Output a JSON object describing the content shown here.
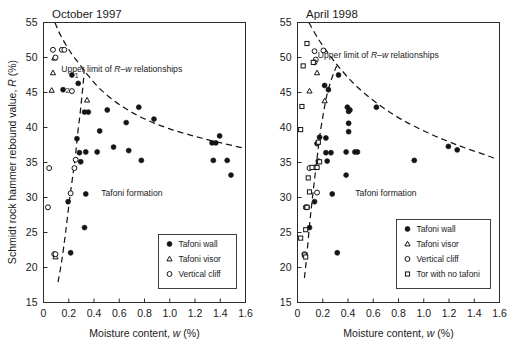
{
  "figure": {
    "width": 519,
    "height": 360,
    "background": "#ffffff",
    "ink_color": "#141414"
  },
  "axis": {
    "y_label": "Schmidt rock hammer rebound value, R (%)",
    "x_label": "Moisture content, w (%)",
    "y_ticks": [
      15,
      20,
      25,
      30,
      35,
      40,
      45,
      50,
      55
    ],
    "x_ticks": [
      "0",
      "0.2",
      "0.4",
      "0.6",
      "0.8",
      "1.0",
      "1.2",
      "1.4",
      "1.6"
    ],
    "ylim": [
      15,
      55
    ],
    "xlim": [
      0,
      1.6
    ]
  },
  "chart_data": [
    {
      "type": "scatter",
      "title": "October 1997",
      "xlabel": "Moisture content, w (%)",
      "ylabel": "Schmidt rock hammer rebound value, R (%)",
      "xlim": [
        0,
        1.6
      ],
      "ylim": [
        15,
        55
      ],
      "grid": false,
      "legend_position": "lower-right",
      "annotations": [
        {
          "text": "Upper limit of R–w relationships",
          "x": 0.62,
          "y": 48.0
        },
        {
          "text": "Tafoni formation",
          "x": 0.7,
          "y": 30.2
        },
        {
          "text": "1",
          "x": 0.245,
          "y": 47.5
        },
        {
          "text": "2",
          "x": 0.175,
          "y": 45.3
        }
      ],
      "series": [
        {
          "name": "Tafoni wall",
          "marker": "filled-circle",
          "points": [
            [
              0.225,
              47.5
            ],
            [
              0.155,
              45.4
            ],
            [
              0.275,
              46.3
            ],
            [
              0.325,
              42.2
            ],
            [
              0.355,
              42.2
            ],
            [
              0.505,
              42.5
            ],
            [
              0.445,
              39.5
            ],
            [
              0.655,
              40.7
            ],
            [
              0.755,
              42.9
            ],
            [
              0.875,
              41.2
            ],
            [
              0.335,
              36.5
            ],
            [
              0.425,
              36.5
            ],
            [
              0.555,
              37.2
            ],
            [
              0.675,
              36.7
            ],
            [
              0.775,
              35.3
            ],
            [
              0.265,
              38.4
            ],
            [
              0.295,
              35.1
            ],
            [
              0.285,
              36.4
            ],
            [
              0.335,
              30.5
            ],
            [
              0.325,
              25.7
            ],
            [
              0.195,
              29.4
            ],
            [
              0.215,
              22.1
            ],
            [
              1.335,
              37.8
            ],
            [
              1.365,
              37.8
            ],
            [
              1.395,
              38.8
            ],
            [
              1.345,
              35.3
            ],
            [
              1.455,
              35.3
            ],
            [
              1.485,
              33.2
            ]
          ]
        },
        {
          "name": "Tafoni visor",
          "marker": "open-triangle",
          "points": [
            [
              0.085,
              49.9
            ],
            [
              0.075,
              47.8
            ],
            [
              0.065,
              45.3
            ],
            [
              0.345,
              43.9
            ],
            [
              0.095,
              21.5
            ]
          ]
        },
        {
          "name": "Vertical cliff",
          "marker": "open-circle",
          "points": [
            [
              0.075,
              51.1
            ],
            [
              0.145,
              51.1
            ],
            [
              0.165,
              51.1
            ],
            [
              0.095,
              50.0
            ],
            [
              0.225,
              45.2
            ],
            [
              0.255,
              35.4
            ],
            [
              0.045,
              34.2
            ],
            [
              0.245,
              34.2
            ],
            [
              0.215,
              30.6
            ],
            [
              0.035,
              28.6
            ],
            [
              0.085,
              21.9
            ],
            [
              0.095,
              21.9
            ]
          ]
        }
      ],
      "upper_limit_curve": [
        [
          0.09,
          55.0
        ],
        [
          0.14,
          53.0
        ],
        [
          0.22,
          50.6
        ],
        [
          0.3,
          48.7
        ],
        [
          0.36,
          47.3
        ],
        [
          0.46,
          45.3
        ],
        [
          0.6,
          43.3
        ],
        [
          0.78,
          41.4
        ],
        [
          1.0,
          39.8
        ],
        [
          1.25,
          38.5
        ],
        [
          1.5,
          37.4
        ],
        [
          1.58,
          37.1
        ]
      ],
      "lower_limit_curve": [
        [
          0.115,
          17.9
        ],
        [
          0.145,
          21.0
        ],
        [
          0.175,
          25.0
        ],
        [
          0.205,
          29.5
        ],
        [
          0.235,
          33.5
        ],
        [
          0.255,
          36.3
        ],
        [
          0.272,
          39.3
        ],
        [
          0.29,
          42.0
        ],
        [
          0.305,
          44.6
        ],
        [
          0.318,
          47.0
        ],
        [
          0.322,
          48.3
        ]
      ]
    },
    {
      "type": "scatter",
      "title": "April 1998",
      "xlabel": "Moisture content, w (%)",
      "ylabel": "Schmidt rock hammer rebound value, R (%)",
      "xlim": [
        0,
        1.6
      ],
      "ylim": [
        15,
        55
      ],
      "grid": false,
      "legend_position": "lower-right",
      "annotations": [
        {
          "text": "Upper limit of R–w relationships",
          "x": 0.64,
          "y": 50.0
        },
        {
          "text": "Tafoni formation",
          "x": 0.7,
          "y": 30.2
        }
      ],
      "series": [
        {
          "name": "Tafoni wall",
          "marker": "filled-circle",
          "points": [
            [
              0.325,
              47.5
            ],
            [
              0.245,
              45.4
            ],
            [
              0.215,
              46.0
            ],
            [
              0.395,
              42.9
            ],
            [
              0.405,
              42.3
            ],
            [
              0.415,
              42.5
            ],
            [
              0.625,
              42.9
            ],
            [
              0.405,
              40.6
            ],
            [
              0.405,
              39.4
            ],
            [
              0.175,
              38.6
            ],
            [
              0.225,
              38.5
            ],
            [
              0.155,
              37.7
            ],
            [
              0.225,
              36.4
            ],
            [
              0.265,
              36.4
            ],
            [
              0.385,
              36.5
            ],
            [
              0.455,
              36.5
            ],
            [
              0.475,
              36.5
            ],
            [
              0.235,
              35.2
            ],
            [
              0.165,
              35.2
            ],
            [
              0.385,
              33.2
            ],
            [
              0.275,
              30.5
            ],
            [
              0.135,
              29.4
            ],
            [
              0.095,
              25.7
            ],
            [
              0.315,
              22.1
            ],
            [
              0.925,
              35.3
            ],
            [
              1.195,
              37.3
            ],
            [
              1.265,
              36.8
            ]
          ]
        },
        {
          "name": "Tafoni visor",
          "marker": "open-triangle",
          "points": [
            [
              0.155,
              47.8
            ],
            [
              0.095,
              45.2
            ],
            [
              0.215,
              43.8
            ]
          ]
        },
        {
          "name": "Vertical cliff",
          "marker": "open-circle",
          "points": [
            [
              0.135,
              50.9
            ],
            [
              0.205,
              51.0
            ],
            [
              0.145,
              49.7
            ],
            [
              0.135,
              49.3
            ],
            [
              0.145,
              34.3
            ],
            [
              0.155,
              30.7
            ],
            [
              0.065,
              28.6
            ],
            [
              0.075,
              28.6
            ],
            [
              0.095,
              34.2
            ],
            [
              0.055,
              21.9
            ]
          ]
        },
        {
          "name": "Tor with no tafoni",
          "marker": "open-square",
          "points": [
            [
              0.075,
              52.0
            ],
            [
              0.045,
              48.8
            ],
            [
              0.125,
              49.3
            ],
            [
              0.035,
              43.0
            ],
            [
              0.025,
              39.7
            ],
            [
              0.165,
              37.9
            ],
            [
              0.115,
              34.3
            ],
            [
              0.155,
              34.3
            ],
            [
              0.175,
              35.1
            ],
            [
              0.085,
              32.8
            ],
            [
              0.095,
              30.8
            ],
            [
              0.075,
              28.6
            ],
            [
              0.065,
              25.4
            ],
            [
              0.025,
              24.2
            ],
            [
              0.055,
              21.8
            ],
            [
              0.065,
              21.5
            ]
          ]
        }
      ],
      "upper_limit_curve": [
        [
          0.09,
          55.0
        ],
        [
          0.17,
          52.5
        ],
        [
          0.26,
          50.2
        ],
        [
          0.33,
          48.6
        ],
        [
          0.45,
          46.2
        ],
        [
          0.62,
          43.6
        ],
        [
          0.82,
          41.2
        ],
        [
          1.05,
          39.1
        ],
        [
          1.28,
          37.4
        ],
        [
          1.5,
          36.0
        ],
        [
          1.56,
          35.6
        ]
      ],
      "lower_limit_curve": [
        [
          0.055,
          18.5
        ],
        [
          0.075,
          22.0
        ],
        [
          0.095,
          26.0
        ],
        [
          0.115,
          29.4
        ],
        [
          0.135,
          32.6
        ],
        [
          0.155,
          35.6
        ],
        [
          0.175,
          38.6
        ],
        [
          0.205,
          42.0
        ],
        [
          0.235,
          44.8
        ],
        [
          0.275,
          47.2
        ],
        [
          0.31,
          48.8
        ]
      ]
    }
  ],
  "legends": [
    {
      "panel": "October 1997",
      "entries": [
        {
          "marker": "filled-circle",
          "label": "Tafoni wall"
        },
        {
          "marker": "open-triangle",
          "label": "Tafoni visor"
        },
        {
          "marker": "open-circle",
          "label": "Vertical cliff"
        }
      ]
    },
    {
      "panel": "April 1998",
      "entries": [
        {
          "marker": "filled-circle",
          "label": "Tafoni wall"
        },
        {
          "marker": "open-triangle",
          "label": "Tafoni visor"
        },
        {
          "marker": "open-circle",
          "label": "Vertical cliff"
        },
        {
          "marker": "open-square",
          "label": "Tor with no tafoni"
        }
      ]
    }
  ]
}
